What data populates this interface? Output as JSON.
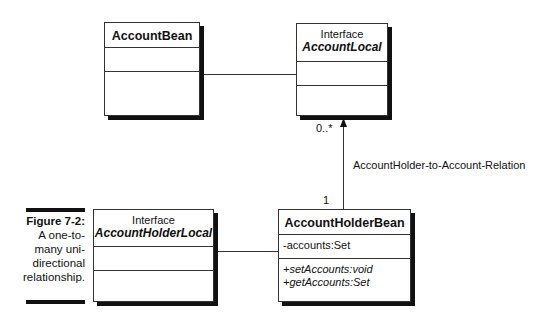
{
  "figure": {
    "number": "Figure 7-2:",
    "caption_lines": [
      "A one-to-",
      "many uni-",
      "directional",
      "relationship."
    ]
  },
  "classes": {
    "account_bean": {
      "name": "AccountBean",
      "attributes": [],
      "operations": []
    },
    "account_local": {
      "stereotype": "Interface",
      "name": "AccountLocal",
      "attributes": [],
      "operations": []
    },
    "account_holder_local": {
      "stereotype": "Interface",
      "name": "AccountHolderLocal",
      "attributes": [],
      "operations": []
    },
    "account_holder_bean": {
      "name": "AccountHolderBean",
      "attributes": [
        "-accounts:Set"
      ],
      "operations": [
        "+setAccounts:void",
        "+getAccounts:Set"
      ]
    }
  },
  "relations": {
    "main": {
      "label": "AccountHolder-to-Account-Relation",
      "source_multiplicity": "1",
      "target_multiplicity": "0..*"
    }
  }
}
